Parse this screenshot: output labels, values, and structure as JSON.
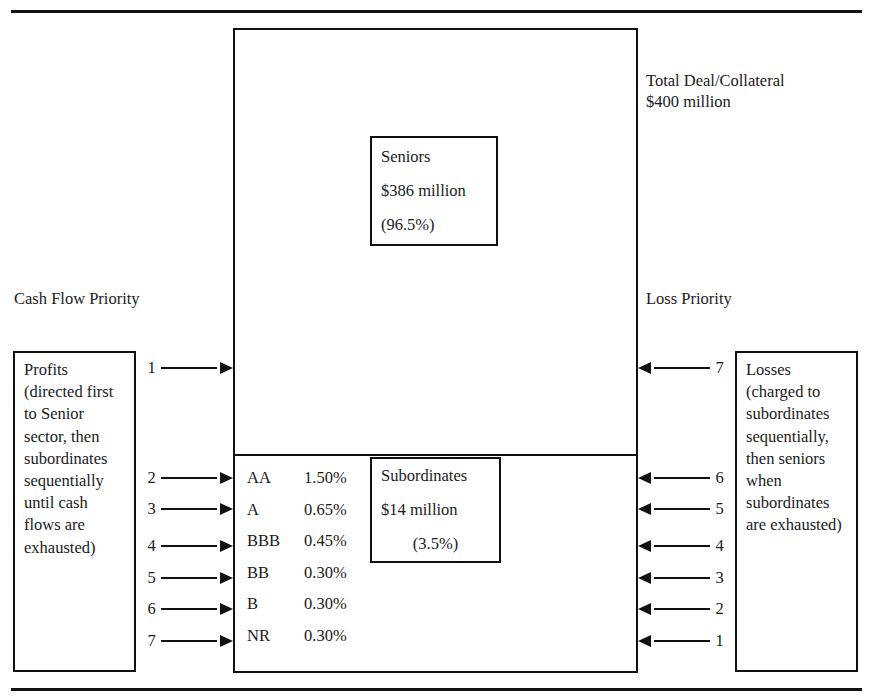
{
  "diagram": {
    "line_color": "#111111",
    "background": "#ffffff"
  },
  "deal": {
    "total_caption": "Total Deal/Collateral\n$400 million"
  },
  "seniors": {
    "label": "Seniors",
    "amount": "$386 million",
    "percent": "(96.5%)"
  },
  "subordinates": {
    "label": "Subordinates",
    "amount": "$14 million",
    "percent": "(3.5%)"
  },
  "cash_flow": {
    "heading": "Cash Flow Priority",
    "note": "Profits (directed first to Senior sector, then subordinates sequentially until cash flows are exhausted)"
  },
  "loss": {
    "heading": "Loss Priority",
    "note": "Losses (charged to subordinates sequentially, then seniors when subordinates are exhausted)"
  },
  "tranches": [
    {
      "rating": "AA",
      "rate": "1.50%"
    },
    {
      "rating": "A",
      "rate": "0.65%"
    },
    {
      "rating": "BBB",
      "rate": "0.45%"
    },
    {
      "rating": "BB",
      "rate": "0.30%"
    },
    {
      "rating": "B",
      "rate": "0.30%"
    },
    {
      "rating": "NR",
      "rate": "0.30%"
    }
  ],
  "cash_flow_arrows": [
    {
      "number": "1"
    },
    {
      "number": "2"
    },
    {
      "number": "3"
    },
    {
      "number": "4"
    },
    {
      "number": "5"
    },
    {
      "number": "6"
    },
    {
      "number": "7"
    }
  ],
  "loss_arrows": [
    {
      "number": "7"
    },
    {
      "number": "6"
    },
    {
      "number": "5"
    },
    {
      "number": "4"
    },
    {
      "number": "3"
    },
    {
      "number": "2"
    },
    {
      "number": "1"
    }
  ]
}
